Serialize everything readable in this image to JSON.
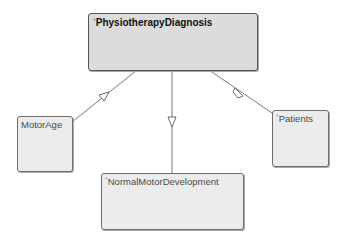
{
  "diagram": {
    "type": "class-generalization",
    "parent": {
      "id": "physiotherapy-diagnosis",
      "marker": "*",
      "label": "PhysiotherapyDiagnosis"
    },
    "children": [
      {
        "id": "motor-age",
        "marker": "",
        "label": "MotorAge"
      },
      {
        "id": "normal-motor-development",
        "marker": "*",
        "label": "NormalMotorDevelopment"
      },
      {
        "id": "patients",
        "marker": "*",
        "label": "Patients"
      }
    ],
    "edges": [
      {
        "from": "motor-age",
        "to": "physiotherapy-diagnosis",
        "arrowhead": "hollow-triangle"
      },
      {
        "from": "normal-motor-development",
        "to": "physiotherapy-diagnosis",
        "arrowhead": "hollow-triangle"
      },
      {
        "from": "patients",
        "to": "physiotherapy-diagnosis",
        "arrowhead": "hollow-triangle"
      }
    ],
    "colors": {
      "node_fill": "#ececec",
      "parent_fill": "#dcdcdc",
      "node_border": "#6e6e6e",
      "edge": "#7a7a7a"
    }
  }
}
